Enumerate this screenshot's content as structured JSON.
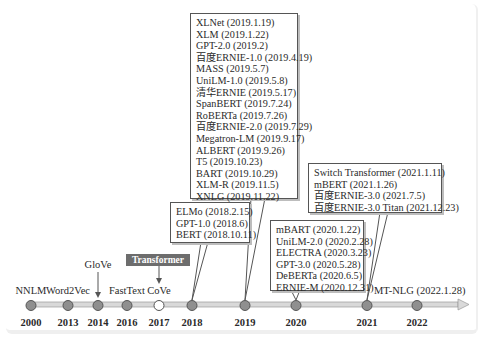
{
  "timeline": {
    "nodes": [
      {
        "year": "2000",
        "label": "NNLM",
        "x": 31
      },
      {
        "year": "2013",
        "label": "Word2Vec",
        "x": 68
      },
      {
        "year": "2014",
        "label": "GloVe",
        "x": 98
      },
      {
        "year": "2016",
        "label": "FastText",
        "x": 127
      },
      {
        "year": "2017",
        "label": "CoVe",
        "x": 159
      },
      {
        "year": "2018",
        "label": "",
        "x": 192
      },
      {
        "year": "2019",
        "label": "",
        "x": 245
      },
      {
        "year": "2020",
        "label": "",
        "x": 296
      },
      {
        "year": "2021",
        "label": "",
        "x": 367
      },
      {
        "year": "2022",
        "label": "",
        "x": 417
      }
    ],
    "highlight_badge": "Transformer",
    "end_label": "MT-NLG (2022.1.28)"
  },
  "boxes": {
    "y2018": [
      "ELMo (2018.2.15)",
      "GPT-1.0 (2018.6)",
      "BERT (2018.10.11)"
    ],
    "y2019": [
      "XLNet (2019.1.19)",
      "XLM (2019.1.22)",
      "GPT-2.0 (2019.2)",
      "百度ERNIE-1.0 (2019.4.19)",
      "MASS (2019.5.7)",
      "UniLM-1.0 (2019.5.8)",
      "清华ERNIE (2019.5.17)",
      "SpanBERT (2019.7.24)",
      "RoBERTa (2019.7.26)",
      "百度ERNIE-2.0 (2019.7.29)",
      "Megatron-LM (2019.9.17)",
      "ALBERT (2019.9.26)",
      "T5 (2019.10.23)",
      "BART (2019.10.29)",
      "XLM-R (2019.11.5)",
      "XNLG (2019.11.22)"
    ],
    "y2020": [
      "mBART (2020.1.22)",
      "UniLM-2.0 (2020.2.28)",
      "ELECTRA (2020.3.23)",
      "GPT-3.0 (2020.5.28)",
      "DeBERTa (2020.6.5)",
      "ERNIE-M (2020.12.31)"
    ],
    "y2021": [
      "Switch Transformer (2021.1.11)",
      "mBERT (2021.1.26)",
      "百度ERNIE-3.0 (2021.7.5)",
      "百度ERNIE-3.0 Titan (2021.12.23)"
    ]
  },
  "colors": {
    "node_fill": "#8f8f8f",
    "badge_bg": "#6d6d6d",
    "axis": "#d9d9d9",
    "border": "#555555"
  }
}
